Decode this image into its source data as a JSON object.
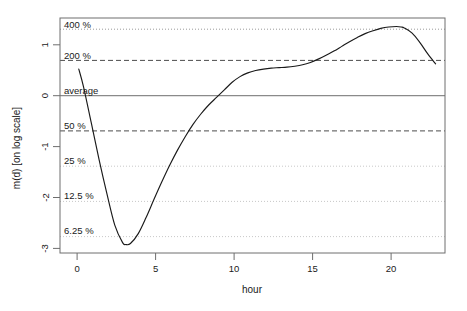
{
  "chart_data": {
    "type": "line",
    "title": "",
    "xlabel": "hour",
    "ylabel": "m(d) [on log scale]",
    "xlim": [
      -1.0,
      23.6
    ],
    "ylim": [
      -3.35,
      1.62
    ],
    "grid": true,
    "legend": null,
    "x_ticks": [
      0,
      5,
      10,
      15,
      20
    ],
    "x_tick_labels": [
      "0",
      "5",
      "10",
      "15",
      "20"
    ],
    "y_ticks": [
      1,
      0,
      -1,
      -2,
      -3
    ],
    "y_tick_labels": [
      "1",
      "0",
      "-1",
      "-2",
      "-3"
    ],
    "reference_lines": [
      {
        "label": "400 %",
        "value": 1.386,
        "style": "dotted",
        "color": "#9a9a9a"
      },
      {
        "label": "200 %",
        "value": 0.693,
        "style": "dashed",
        "color": "#4d4d4d"
      },
      {
        "label": "average",
        "value": 0.0,
        "style": "solid",
        "color": "#8a8a8a"
      },
      {
        "label": "50 %",
        "value": -0.693,
        "style": "dashed",
        "color": "#4d4d4d"
      },
      {
        "label": "25 %",
        "value": -1.386,
        "style": "dotted",
        "color": "#c8c8c8"
      },
      {
        "label": "12.5 %",
        "value": -2.079,
        "style": "dotted",
        "color": "#c8c8c8"
      },
      {
        "label": "6.25 %",
        "value": -2.773,
        "style": "dotted",
        "color": "#c8c8c8"
      }
    ],
    "series": [
      {
        "name": "m(d)",
        "x": [
          0.2,
          0.5,
          1.0,
          1.5,
          2.0,
          2.5,
          3.0,
          3.2,
          3.5,
          4.0,
          4.5,
          5.0,
          5.5,
          6.0,
          6.5,
          7.0,
          7.5,
          8.0,
          8.5,
          9.0,
          9.5,
          10.0,
          10.5,
          11.0,
          11.5,
          12.0,
          12.5,
          13.0,
          13.5,
          14.0,
          14.5,
          15.0,
          15.5,
          16.0,
          16.5,
          17.0,
          17.5,
          18.0,
          18.5,
          19.0,
          19.5,
          20.0,
          20.5,
          20.8,
          21.0,
          21.5,
          22.0,
          22.5,
          23.0
        ],
        "y": [
          0.54,
          0.17,
          -0.6,
          -1.38,
          -2.1,
          -2.76,
          -3.13,
          -3.17,
          -3.15,
          -2.94,
          -2.6,
          -2.22,
          -1.85,
          -1.5,
          -1.18,
          -0.89,
          -0.63,
          -0.41,
          -0.22,
          -0.06,
          0.1,
          0.26,
          0.38,
          0.46,
          0.51,
          0.54,
          0.56,
          0.57,
          0.58,
          0.6,
          0.63,
          0.68,
          0.75,
          0.83,
          0.92,
          1.02,
          1.12,
          1.21,
          1.29,
          1.35,
          1.4,
          1.43,
          1.44,
          1.43,
          1.41,
          1.3,
          1.1,
          0.86,
          0.65
        ]
      }
    ]
  },
  "axis": {
    "x_title": "hour",
    "y_title": "m(d) [on log scale]"
  }
}
